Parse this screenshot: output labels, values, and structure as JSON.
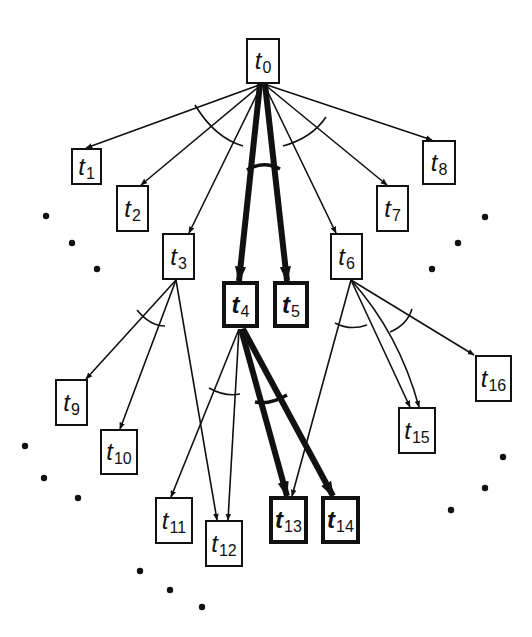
{
  "diagram": {
    "type": "and-or task tree",
    "colors": {
      "line": "#111111",
      "background": "#ffffff"
    },
    "nodes": [
      {
        "id": "t0",
        "label": "t",
        "sub": "0",
        "x": 246,
        "y": 38,
        "w": 34,
        "h": 46,
        "bold": false
      },
      {
        "id": "t1",
        "label": "t",
        "sub": "1",
        "x": 71,
        "y": 148,
        "w": 31,
        "h": 37,
        "bold": false
      },
      {
        "id": "t2",
        "label": "t",
        "sub": "2",
        "x": 116,
        "y": 185,
        "w": 33,
        "h": 47,
        "bold": false
      },
      {
        "id": "t3",
        "label": "t",
        "sub": "3",
        "x": 162,
        "y": 233,
        "w": 33,
        "h": 47,
        "bold": false
      },
      {
        "id": "t4",
        "label": "t",
        "sub": "4",
        "x": 222,
        "y": 281,
        "w": 37,
        "h": 47,
        "bold": true
      },
      {
        "id": "t5",
        "label": "t",
        "sub": "5",
        "x": 273,
        "y": 281,
        "w": 36,
        "h": 47,
        "bold": true
      },
      {
        "id": "t6",
        "label": "t",
        "sub": "6",
        "x": 330,
        "y": 233,
        "w": 33,
        "h": 47,
        "bold": false
      },
      {
        "id": "t7",
        "label": "t",
        "sub": "7",
        "x": 376,
        "y": 185,
        "w": 33,
        "h": 47,
        "bold": false
      },
      {
        "id": "t8",
        "label": "t",
        "sub": "8",
        "x": 422,
        "y": 140,
        "w": 34,
        "h": 45,
        "bold": false
      },
      {
        "id": "t9",
        "label": "t",
        "sub": "9",
        "x": 55,
        "y": 379,
        "w": 33,
        "h": 47,
        "bold": false
      },
      {
        "id": "t10",
        "label": "t",
        "sub": "10",
        "x": 100,
        "y": 429,
        "w": 38,
        "h": 46,
        "bold": false
      },
      {
        "id": "t11",
        "label": "t",
        "sub": "11",
        "x": 155,
        "y": 497,
        "w": 38,
        "h": 47,
        "bold": false
      },
      {
        "id": "t12",
        "label": "t",
        "sub": "12",
        "x": 205,
        "y": 520,
        "w": 38,
        "h": 47,
        "bold": false
      },
      {
        "id": "t13",
        "label": "t",
        "sub": "13",
        "x": 269,
        "y": 496,
        "w": 39,
        "h": 48,
        "bold": true
      },
      {
        "id": "t14",
        "label": "t",
        "sub": "14",
        "x": 321,
        "y": 496,
        "w": 39,
        "h": 48,
        "bold": true
      },
      {
        "id": "t15",
        "label": "t",
        "sub": "15",
        "x": 398,
        "y": 407,
        "w": 38,
        "h": 47,
        "bold": false
      },
      {
        "id": "t16",
        "label": "t",
        "sub": "16",
        "x": 475,
        "y": 355,
        "w": 37,
        "h": 47,
        "bold": false
      }
    ],
    "edges": [
      {
        "from": "t0",
        "to": "t1",
        "x1": 262,
        "y1": 84,
        "x2": 86,
        "y2": 148,
        "bold": false
      },
      {
        "from": "t0",
        "to": "t2",
        "x1": 262,
        "y1": 84,
        "x2": 141,
        "y2": 185,
        "bold": false
      },
      {
        "from": "t0",
        "to": "t3",
        "x1": 262,
        "y1": 84,
        "x2": 189,
        "y2": 233,
        "bold": false
      },
      {
        "from": "t0",
        "to": "t4",
        "x1": 260,
        "y1": 84,
        "x2": 239,
        "y2": 281,
        "bold": true
      },
      {
        "from": "t0",
        "to": "t5",
        "x1": 265,
        "y1": 84,
        "x2": 287,
        "y2": 281,
        "bold": true
      },
      {
        "from": "t0",
        "to": "t6",
        "x1": 264,
        "y1": 84,
        "x2": 336,
        "y2": 233,
        "bold": false
      },
      {
        "from": "t0",
        "to": "t7",
        "x1": 264,
        "y1": 84,
        "x2": 387,
        "y2": 185,
        "bold": false
      },
      {
        "from": "t0",
        "to": "t8",
        "x1": 264,
        "y1": 84,
        "x2": 432,
        "y2": 140,
        "bold": false
      },
      {
        "from": "t3",
        "to": "t9",
        "x1": 176,
        "y1": 280,
        "x2": 86,
        "y2": 379,
        "bold": false
      },
      {
        "from": "t3",
        "to": "t10",
        "x1": 176,
        "y1": 280,
        "x2": 120,
        "y2": 429,
        "bold": false
      },
      {
        "from": "t3",
        "to": "t12",
        "x1": 176,
        "y1": 280,
        "x2": 217,
        "y2": 520,
        "bold": false
      },
      {
        "from": "t4",
        "to": "t11",
        "x1": 239,
        "y1": 329,
        "x2": 171,
        "y2": 497,
        "bold": false
      },
      {
        "from": "t4",
        "to": "t12",
        "x1": 239,
        "y1": 329,
        "x2": 228,
        "y2": 520,
        "bold": false
      },
      {
        "from": "t4",
        "to": "t13",
        "x1": 241,
        "y1": 329,
        "x2": 287,
        "y2": 496,
        "bold": true
      },
      {
        "from": "t4",
        "to": "t14",
        "x1": 243,
        "y1": 329,
        "x2": 333,
        "y2": 496,
        "bold": true
      },
      {
        "from": "t6",
        "to": "t13",
        "x1": 351,
        "y1": 280,
        "x2": 292,
        "y2": 496,
        "bold": false
      },
      {
        "from": "t6",
        "to": "t15",
        "x1": 351,
        "y1": 280,
        "x2": 410,
        "y2": 407,
        "bold": false,
        "curve": 0
      },
      {
        "from": "t6",
        "to": "t15",
        "x1": 351,
        "y1": 280,
        "x2": 419,
        "y2": 407,
        "bold": false,
        "curve": 1
      },
      {
        "from": "t6",
        "to": "t16",
        "x1": 351,
        "y1": 280,
        "x2": 474,
        "y2": 355,
        "bold": false
      }
    ],
    "and_arcs": [
      {
        "name": "and-arc-t0-left",
        "d": "M 195 105 Q 215 138 243 146",
        "bold": false
      },
      {
        "name": "and-arc-t0-right",
        "d": "M 283 146 Q 312 138 326 117",
        "bold": false
      },
      {
        "name": "and-arc-t0-center",
        "d": "M 247 170 Q 263 160 280 169",
        "bold": true
      },
      {
        "name": "and-arc-t3",
        "d": "M 137 310 Q 150 326 165 326",
        "bold": false
      },
      {
        "name": "and-arc-t4-left",
        "d": "M 209 388 Q 225 397 240 394",
        "bold": false
      },
      {
        "name": "and-arc-t4-right",
        "d": "M 255 402 Q 270 405 287 395",
        "bold": true
      },
      {
        "name": "and-arc-t6-left",
        "d": "M 335 323 Q 350 331 367 325",
        "bold": false
      },
      {
        "name": "and-arc-t6-right",
        "d": "M 390 332 Q 407 325 412 309",
        "bold": false
      }
    ],
    "ellipsis_dots": [
      {
        "x": 46,
        "y": 216
      },
      {
        "x": 72,
        "y": 243
      },
      {
        "x": 97,
        "y": 269
      },
      {
        "x": 485,
        "y": 217
      },
      {
        "x": 458,
        "y": 243
      },
      {
        "x": 432,
        "y": 269
      },
      {
        "x": 25,
        "y": 446
      },
      {
        "x": 44,
        "y": 478
      },
      {
        "x": 78,
        "y": 498
      },
      {
        "x": 503,
        "y": 457
      },
      {
        "x": 485,
        "y": 488
      },
      {
        "x": 451,
        "y": 510
      },
      {
        "x": 140,
        "y": 571
      },
      {
        "x": 170,
        "y": 590
      },
      {
        "x": 202,
        "y": 607
      }
    ]
  }
}
